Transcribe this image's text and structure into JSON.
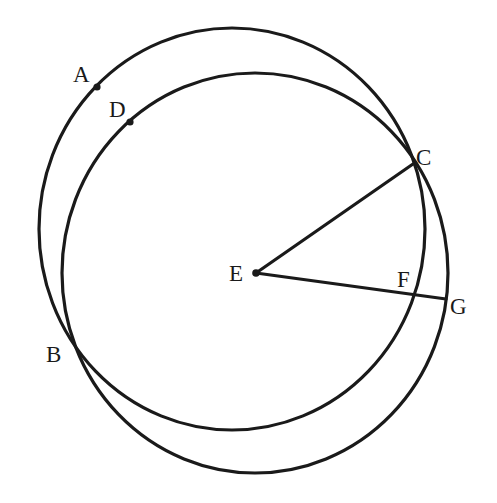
{
  "diagram": {
    "type": "geometry",
    "stroke_color": "#1a1a1a",
    "background_color": "#ffffff",
    "circles": [
      {
        "id": "circle-1",
        "passes_through": [
          "A",
          "B",
          "C",
          "F"
        ],
        "cx": 232,
        "cy": 229,
        "rx": 193,
        "ry": 201
      },
      {
        "id": "circle-2",
        "center": "E",
        "passes_through": [
          "D",
          "B",
          "C",
          "G"
        ],
        "cx": 255,
        "cy": 273,
        "rx": 193,
        "ry": 200
      }
    ],
    "segments": [
      {
        "from": "E",
        "to": "C"
      },
      {
        "from": "E",
        "to": "G"
      }
    ],
    "points": {
      "A": {
        "label": "A",
        "x": 97,
        "y": 87,
        "dot": true
      },
      "B": {
        "label": "B",
        "x": 72,
        "y": 352,
        "dot": false
      },
      "C": {
        "label": "C",
        "x": 413,
        "y": 164,
        "dot": false
      },
      "D": {
        "label": "D",
        "x": 130,
        "y": 122,
        "dot": true
      },
      "E": {
        "label": "E",
        "x": 256,
        "y": 273,
        "dot": true
      },
      "F": {
        "label": "F",
        "x": 416,
        "y": 295,
        "dot": false
      },
      "G": {
        "label": "G",
        "x": 446,
        "y": 299,
        "dot": false
      }
    }
  }
}
